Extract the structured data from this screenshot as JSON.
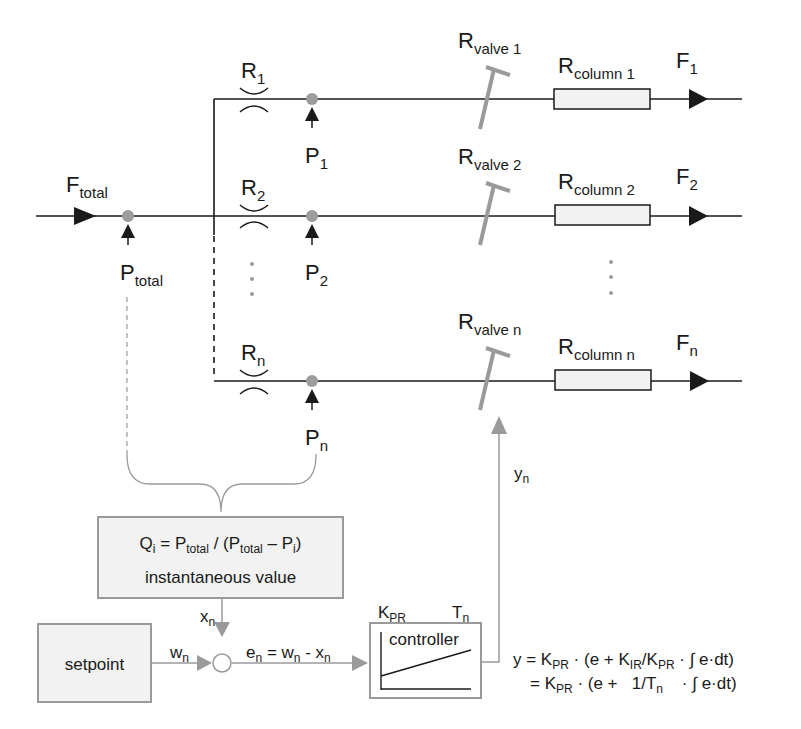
{
  "diagram": {
    "inlet": {
      "flow_label": "F",
      "flow_sub": "total",
      "pressure_label": "P",
      "pressure_sub": "total"
    },
    "branches": [
      {
        "restrictor": "R",
        "restrictor_sub": "1",
        "pressure": "P",
        "pressure_sub": "1",
        "valve": "R",
        "valve_sub": "valve 1",
        "column": "R",
        "column_sub": "column 1",
        "flow": "F",
        "flow_sub": "1"
      },
      {
        "restrictor": "R",
        "restrictor_sub": "2",
        "pressure": "P",
        "pressure_sub": "2",
        "valve": "R",
        "valve_sub": "valve 2",
        "column": "R",
        "column_sub": "column 2",
        "flow": "F",
        "flow_sub": "2"
      },
      {
        "restrictor": "R",
        "restrictor_sub": "n",
        "pressure": "P",
        "pressure_sub": "n",
        "valve": "R",
        "valve_sub": "valve n",
        "column": "R",
        "column_sub": "column n",
        "flow": "F",
        "flow_sub": "n"
      }
    ],
    "calc_box": {
      "q": "Q",
      "q_sub": "i",
      "eq": " = P",
      "p1_sub": "total",
      "mid": " / (P",
      "p2_sub": "total",
      "minus": " – P",
      "pi_sub": "i",
      "close": ")",
      "line2": "instantaneous value"
    },
    "setpoint": {
      "label": "setpoint"
    },
    "signals": {
      "x": "x",
      "x_sub": "n",
      "w": "w",
      "w_sub": "n",
      "e_eq": {
        "e": "e",
        "e_sub": "n",
        "eq": " = w",
        "w_sub": "n",
        "minus": " - x",
        "x_sub": "n"
      },
      "y": "y",
      "y_sub": "n"
    },
    "controller": {
      "label": "controller",
      "kpr": "K",
      "kpr_sub": "PR",
      "tn": "T",
      "tn_sub": "n"
    },
    "formula": {
      "line1": {
        "a": "y = K",
        "a_sub": "PR",
        "b": " · (e + K",
        "b_sub": "IR",
        "c": "/K",
        "c_sub": "PR",
        "d": " · ∫ e·dt)"
      },
      "line2": {
        "a": "= K",
        "a_sub": "PR",
        "b": " · (e +   1/T",
        "b_sub": "n",
        "d": "    · ∫ e·dt)"
      }
    },
    "colors": {
      "line": "#1a1a1a",
      "gray": "#9a9a9a",
      "node": "#9c9c9c",
      "box_fill": "#f2f2f2"
    }
  }
}
